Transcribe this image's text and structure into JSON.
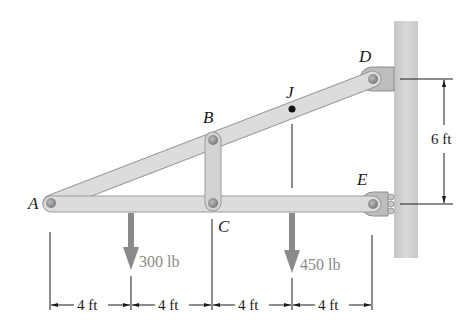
{
  "diagram": {
    "type": "frame-statics",
    "points": {
      "A": {
        "label": "A"
      },
      "B": {
        "label": "B"
      },
      "C": {
        "label": "C"
      },
      "D": {
        "label": "D"
      },
      "E": {
        "label": "E"
      },
      "J": {
        "label": "J"
      }
    },
    "loads": [
      {
        "name": "load-300",
        "label": "300 lb"
      },
      {
        "name": "load-450",
        "label": "450 lb"
      }
    ],
    "dimensions": {
      "horizontal": [
        "4 ft",
        "4 ft",
        "4 ft",
        "4 ft"
      ],
      "vertical": "6 ft"
    },
    "colors": {
      "member_fill": "#d9d9d9",
      "member_stroke": "#9a9a9a",
      "pin": "#8c8c8c",
      "wall": "#d0d0d0",
      "load_arrow": "#8a8a8a",
      "line": "#1a1a1a"
    }
  }
}
